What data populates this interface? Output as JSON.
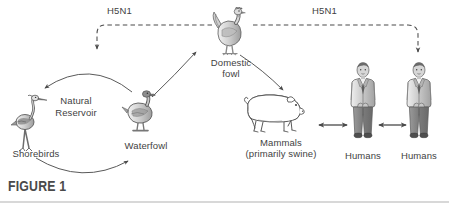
{
  "figure": {
    "caption": "FIGURE 1"
  },
  "virus_labels": {
    "left": "H5N1",
    "right": "H5N1"
  },
  "nodes": {
    "shorebirds": {
      "label": "Shorebirds",
      "icon": "shorebird-icon"
    },
    "waterfowl": {
      "label": "Waterfowl",
      "icon": "duck-icon"
    },
    "reservoir": {
      "label_line1": "Natural",
      "label_line2": "Reservoir"
    },
    "domestic_fowl": {
      "label_line1": "Domestic",
      "label_line2": "fowl",
      "icon": "chicken-icon"
    },
    "mammals": {
      "label_line1": "Mammals",
      "label_line2": "(primarily swine)",
      "icon": "pig-icon"
    },
    "human_left": {
      "label": "Humans",
      "icon": "human-icon"
    },
    "human_right": {
      "label": "Humans",
      "icon": "human-icon"
    }
  },
  "colors": {
    "stroke": "#4a4a4a",
    "text": "#3f3f3f",
    "rule": "#d8d8d8",
    "background": "#ffffff",
    "fill_light": "#e8e8e8",
    "fill_mid": "#b8b8b8",
    "fill_dark": "#7a7a7a"
  }
}
